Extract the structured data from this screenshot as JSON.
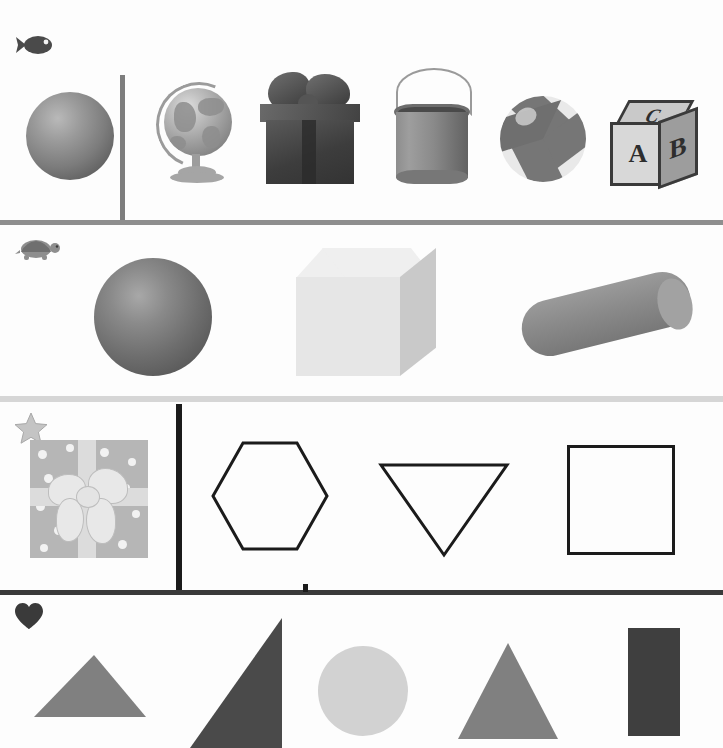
{
  "page": {
    "background_color": "#fdfdfd",
    "width": 723,
    "height": 748
  },
  "rows": [
    {
      "id": "row-1",
      "marker_icon": "fish-icon",
      "marker_label": "fish",
      "marker_color": "#4a4a4a",
      "divider_below": {
        "color": "#8e8e8e",
        "thickness": 5
      },
      "vertical_divider": {
        "present": true,
        "x": 122,
        "color": "#7d7d7d",
        "thickness": 5
      },
      "items": [
        {
          "name": "sphere",
          "label": "Sphere",
          "group": "left",
          "color": "#7c7c7c"
        },
        {
          "name": "globe",
          "label": "Globe",
          "group": "right",
          "color": "#a3a3a3"
        },
        {
          "name": "gift-box",
          "label": "Gift box with bow",
          "group": "right",
          "color": "#3d3d3d"
        },
        {
          "name": "paint-can",
          "label": "Paint can",
          "group": "right",
          "color": "#8a8a8a"
        },
        {
          "name": "beach-ball",
          "label": "Beach ball",
          "group": "right",
          "color": "#767676"
        },
        {
          "name": "alphabet-block",
          "label": "Alphabet block",
          "group": "right",
          "color": "#d8d8d8",
          "letters": {
            "top": "C",
            "front": "A",
            "side": "B"
          }
        }
      ]
    },
    {
      "id": "row-2",
      "marker_icon": "turtle-icon",
      "marker_label": "turtle",
      "marker_color": "#8e8e8e",
      "divider_below": {
        "color": "#d6d6d6",
        "thickness": 6
      },
      "vertical_divider": {
        "present": false
      },
      "items": [
        {
          "name": "sphere",
          "label": "Sphere",
          "color": "#6e6e6e"
        },
        {
          "name": "cube",
          "label": "Cube",
          "color": "#e6e6e6"
        },
        {
          "name": "cylinder",
          "label": "Cylinder",
          "color": "#8a8a8a"
        }
      ]
    },
    {
      "id": "row-3",
      "marker_icon": "star-icon",
      "marker_label": "star",
      "marker_color": "#bdbdbd",
      "divider_below": {
        "color": "#3a3a3a",
        "thickness": 5
      },
      "vertical_divider": {
        "present": true,
        "x": 179,
        "color": "#1b1b1b",
        "thickness": 6
      },
      "items": [
        {
          "name": "polka-dot-gift",
          "label": "Polka dot gift box",
          "group": "left",
          "color": "#b6b6b6"
        },
        {
          "name": "hexagon-outline",
          "label": "Hexagon",
          "group": "right",
          "color": "#1b1b1b"
        },
        {
          "name": "inverted-triangle-outline",
          "label": "Inverted triangle",
          "group": "right",
          "color": "#1b1b1b"
        },
        {
          "name": "square-outline",
          "label": "Square",
          "group": "right",
          "color": "#1b1b1b"
        }
      ]
    },
    {
      "id": "row-4",
      "marker_icon": "heart-icon",
      "marker_label": "heart",
      "marker_color": "#3a3a3a",
      "divider_below": {
        "color": "none",
        "thickness": 0
      },
      "vertical_divider": {
        "present": false
      },
      "items": [
        {
          "name": "obtuse-triangle",
          "label": "Obtuse triangle",
          "color": "#808080"
        },
        {
          "name": "right-triangle",
          "label": "Right triangle",
          "color": "#4a4a4a"
        },
        {
          "name": "circle",
          "label": "Circle",
          "color": "#d2d2d2"
        },
        {
          "name": "equilateral-triangle",
          "label": "Triangle",
          "color": "#808080"
        },
        {
          "name": "rectangle",
          "label": "Rectangle",
          "color": "#3f3f3f"
        }
      ]
    }
  ],
  "separator_stub": {
    "x": 305,
    "color": "#1b1b1b",
    "label": "top separator tick"
  }
}
